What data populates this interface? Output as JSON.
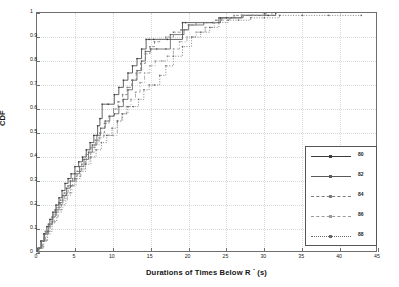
{
  "chart_data": {
    "type": "line",
    "subtype": "step-cdf",
    "title": "",
    "xlabel": "Durations of Times Below R⁻ (s)",
    "xlabel_base": "Durations of Times Below R",
    "xlabel_sup": "-",
    "xlabel_unit": "(s)",
    "ylabel": "CDF",
    "xlim": [
      0,
      45
    ],
    "ylim": [
      0,
      1
    ],
    "xticks": [
      0,
      5,
      10,
      15,
      20,
      25,
      30,
      35,
      40,
      45
    ],
    "yticks": [
      0,
      0.1,
      0.2,
      0.3,
      0.4,
      0.5,
      0.6,
      0.7,
      0.8,
      0.9,
      1
    ],
    "xtick_labels": [
      "0",
      "5",
      "10",
      "15",
      "20",
      "25",
      "30",
      "35",
      "40",
      "45"
    ],
    "ytick_labels": [
      "0",
      "0.1",
      "0.2",
      "0.3",
      "0.4",
      "0.5",
      "0.6",
      "0.7",
      "0.8",
      "0.9",
      "1"
    ],
    "grid": true,
    "grid_style": "dotted",
    "legend_position": "center-right",
    "series": [
      {
        "name": "80",
        "color": "#3b3b3b",
        "marker": "dot",
        "linestyle": "solid",
        "x": [
          0.15,
          0.5,
          0.9,
          1.3,
          1.7,
          2.1,
          2.5,
          2.9,
          3.3,
          3.7,
          4.1,
          4.5,
          5.0,
          5.5,
          6.0,
          6.5,
          7.0,
          7.5,
          8.0,
          8.3,
          8.6,
          9.4,
          10.2,
          10.8,
          11.4,
          12.0,
          12.6,
          13.2,
          13.8,
          14.4,
          14.8,
          15.4,
          17.2,
          19.2,
          19.6,
          23.2,
          24.2,
          25.0,
          27.0,
          30.5,
          31.5
        ],
        "y": [
          0.02,
          0.05,
          0.08,
          0.11,
          0.14,
          0.17,
          0.2,
          0.23,
          0.26,
          0.29,
          0.31,
          0.33,
          0.36,
          0.38,
          0.4,
          0.43,
          0.46,
          0.49,
          0.53,
          0.56,
          0.62,
          0.62,
          0.66,
          0.69,
          0.72,
          0.75,
          0.78,
          0.81,
          0.85,
          0.89,
          0.89,
          0.89,
          0.89,
          0.96,
          0.96,
          0.96,
          0.98,
          0.98,
          0.99,
          0.99,
          1.0
        ]
      },
      {
        "name": "82",
        "color": "#5a5a5a",
        "marker": "dot",
        "linestyle": "solid",
        "x": [
          0.2,
          0.6,
          1.0,
          1.5,
          2.0,
          2.4,
          2.9,
          3.4,
          3.9,
          4.4,
          5.0,
          5.6,
          6.2,
          6.8,
          7.3,
          7.9,
          8.4,
          9.0,
          9.6,
          10.2,
          10.8,
          11.4,
          12.0,
          12.6,
          13.2,
          13.8,
          14.3,
          15.0,
          15.8,
          17.0,
          17.6,
          19.4,
          20.0,
          22.0,
          23.4,
          24.0,
          25.6,
          27.2,
          28.4,
          30.0
        ],
        "y": [
          0.02,
          0.05,
          0.08,
          0.12,
          0.15,
          0.18,
          0.21,
          0.24,
          0.27,
          0.3,
          0.33,
          0.36,
          0.39,
          0.42,
          0.45,
          0.49,
          0.52,
          0.55,
          0.57,
          0.58,
          0.61,
          0.64,
          0.68,
          0.72,
          0.76,
          0.8,
          0.84,
          0.85,
          0.85,
          0.85,
          0.91,
          0.93,
          0.95,
          0.96,
          0.96,
          0.98,
          0.98,
          0.99,
          0.99,
          1.0
        ]
      },
      {
        "name": "84",
        "color": "#7a7a7a",
        "marker": "dot",
        "linestyle": "dashed",
        "x": [
          0.2,
          0.7,
          1.1,
          1.6,
          2.1,
          2.6,
          3.1,
          3.6,
          4.1,
          4.7,
          5.3,
          5.9,
          6.5,
          7.1,
          7.7,
          8.3,
          8.9,
          9.5,
          10.1,
          10.7,
          11.3,
          11.9,
          12.5,
          13.1,
          13.7,
          14.3,
          14.9,
          15.5,
          16.2,
          17.0,
          18.0,
          19.0,
          20.0,
          21.0,
          22.4,
          23.6,
          24.4,
          26.0,
          28.0,
          30.2
        ],
        "y": [
          0.02,
          0.05,
          0.09,
          0.12,
          0.16,
          0.19,
          0.22,
          0.25,
          0.28,
          0.31,
          0.34,
          0.37,
          0.41,
          0.44,
          0.47,
          0.5,
          0.54,
          0.57,
          0.6,
          0.63,
          0.66,
          0.69,
          0.72,
          0.75,
          0.79,
          0.83,
          0.86,
          0.88,
          0.89,
          0.9,
          0.92,
          0.93,
          0.95,
          0.96,
          0.96,
          0.97,
          0.98,
          0.99,
          0.99,
          1.0
        ]
      },
      {
        "name": "86",
        "color": "#9a9a9a",
        "marker": "dot",
        "linestyle": "dashdot",
        "x": [
          0.25,
          0.8,
          1.3,
          1.8,
          2.3,
          2.8,
          3.4,
          4.0,
          4.6,
          5.2,
          5.8,
          6.4,
          7.0,
          7.6,
          8.2,
          8.8,
          9.4,
          10.0,
          10.6,
          11.2,
          11.8,
          12.4,
          13.0,
          13.6,
          14.2,
          14.9,
          15.6,
          16.4,
          17.2,
          18.0,
          18.8,
          19.8,
          21.0,
          22.2,
          23.4,
          24.2,
          25.4,
          27.0,
          29.0,
          31.0
        ],
        "y": [
          0.02,
          0.05,
          0.08,
          0.12,
          0.15,
          0.18,
          0.22,
          0.25,
          0.28,
          0.32,
          0.35,
          0.38,
          0.42,
          0.45,
          0.48,
          0.49,
          0.49,
          0.49,
          0.55,
          0.58,
          0.61,
          0.64,
          0.67,
          0.71,
          0.75,
          0.78,
          0.8,
          0.8,
          0.82,
          0.85,
          0.88,
          0.9,
          0.92,
          0.94,
          0.96,
          0.97,
          0.98,
          0.99,
          0.99,
          1.0
        ]
      },
      {
        "name": "88",
        "color": "#666666",
        "marker": "dot",
        "linestyle": "dotted",
        "x": [
          0.3,
          0.9,
          1.4,
          2.0,
          2.6,
          3.2,
          3.8,
          4.4,
          5.0,
          5.7,
          6.4,
          7.1,
          7.8,
          8.5,
          9.2,
          9.9,
          10.6,
          11.3,
          12.0,
          12.7,
          13.4,
          14.1,
          14.8,
          15.5,
          16.2,
          17.0,
          18.0,
          19.2,
          20.4,
          21.6,
          22.8,
          24.0,
          25.2,
          26.6,
          28.2,
          30.0,
          32.0,
          35.0,
          38.5,
          42.8
        ],
        "y": [
          0.02,
          0.05,
          0.09,
          0.13,
          0.17,
          0.2,
          0.24,
          0.28,
          0.31,
          0.34,
          0.37,
          0.4,
          0.43,
          0.46,
          0.49,
          0.52,
          0.55,
          0.58,
          0.61,
          0.61,
          0.64,
          0.68,
          0.7,
          0.7,
          0.74,
          0.78,
          0.82,
          0.86,
          0.9,
          0.92,
          0.94,
          0.96,
          0.97,
          0.97,
          0.98,
          0.98,
          0.99,
          0.99,
          0.99,
          0.99
        ]
      }
    ],
    "legend_entries": [
      "80",
      "82",
      "84",
      "86",
      "88"
    ]
  },
  "colors": {
    "axis": "#6e6e6e",
    "grid": "#d9d9d9",
    "text": "#1a1a1a",
    "legend_border": "#555555",
    "background": "#ffffff"
  }
}
